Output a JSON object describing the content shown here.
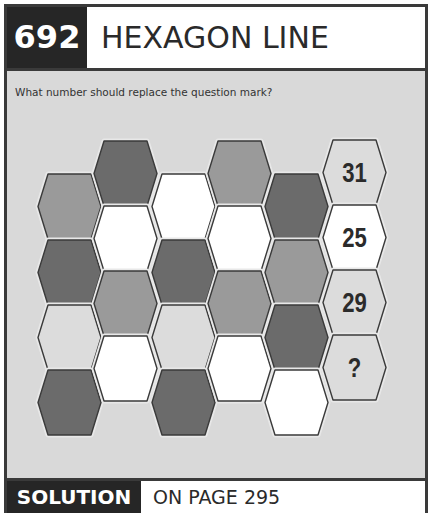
{
  "header": {
    "puzzle_number": "692",
    "title": "HEXAGON LINE"
  },
  "question": "What number should replace the question mark?",
  "footer": {
    "solution_label": "SOLUTION",
    "solution_page": "ON PAGE 295"
  },
  "colors": {
    "dark": "#6b6b6b",
    "medium": "#9a9a9a",
    "light": "#dcdcdc",
    "white": "#ffffff",
    "stroke": "#3a3a3a",
    "background": "#d9d9d9"
  },
  "grid": {
    "columns": [
      {
        "x": 38,
        "tops": [
          174,
          240,
          305,
          370
        ],
        "fills": [
          "medium",
          "dark",
          "light",
          "dark"
        ]
      },
      {
        "x": 94,
        "tops": [
          141,
          206,
          271,
          336
        ],
        "fills": [
          "dark",
          "white",
          "medium",
          "white"
        ]
      },
      {
        "x": 152,
        "tops": [
          174,
          240,
          305,
          370
        ],
        "fills": [
          "white",
          "dark",
          "light",
          "dark"
        ]
      },
      {
        "x": 208,
        "tops": [
          141,
          206,
          271,
          336
        ],
        "fills": [
          "medium",
          "white",
          "medium",
          "white"
        ]
      },
      {
        "x": 265,
        "tops": [
          174,
          240,
          305,
          370
        ],
        "fills": [
          "dark",
          "medium",
          "dark",
          "white"
        ]
      }
    ],
    "answer_column": {
      "x": 323,
      "tops": [
        140,
        205,
        270,
        335
      ],
      "fills": [
        "light",
        "white",
        "light",
        "light"
      ],
      "labels": [
        "31",
        "25",
        "29",
        "?"
      ]
    }
  }
}
